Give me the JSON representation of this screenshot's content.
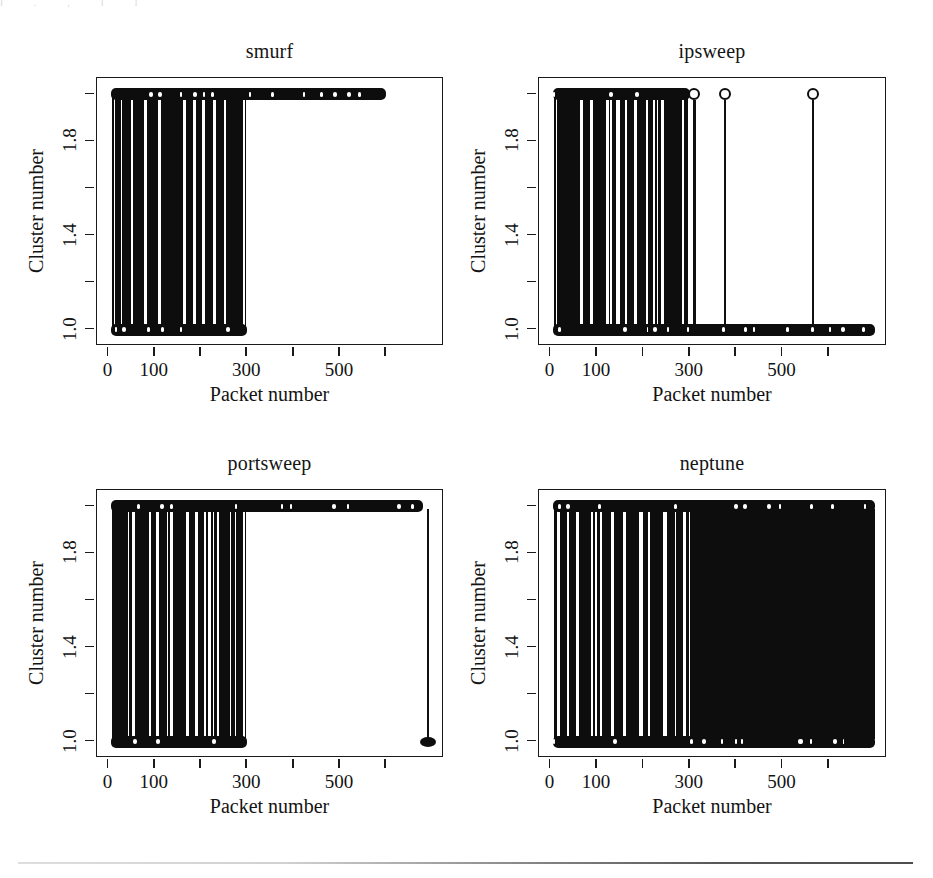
{
  "figure": {
    "width": 933,
    "height": 878,
    "background": "#ffffff",
    "ink": "#0d0d0d",
    "layout": "2x2 grid of panels",
    "scan_artifact_text": "l . , l l"
  },
  "axes": {
    "x_title": "Packet number",
    "y_title": "Cluster number",
    "x_ticks": [
      {
        "value": 0,
        "label": "0"
      },
      {
        "value": 100,
        "label": "100"
      },
      {
        "value": 200,
        "label": ""
      },
      {
        "value": 300,
        "label": "300"
      },
      {
        "value": 400,
        "label": ""
      },
      {
        "value": 500,
        "label": "500"
      },
      {
        "value": 600,
        "label": ""
      }
    ],
    "y_ticks": [
      {
        "value": 1.0,
        "label": "1.0"
      },
      {
        "value": 1.2,
        "label": ""
      },
      {
        "value": 1.4,
        "label": "1.4"
      },
      {
        "value": 1.6,
        "label": ""
      },
      {
        "value": 1.8,
        "label": "1.8"
      },
      {
        "value": 2.0,
        "label": ""
      }
    ],
    "xlim": [
      -25,
      725
    ],
    "ylim": [
      0.93,
      2.07
    ],
    "grid": false,
    "legend": "none"
  },
  "panels": [
    {
      "id": "smurf",
      "title": "smurf"
    },
    {
      "id": "ipsweep",
      "title": "ipsweep"
    },
    {
      "id": "portsweep",
      "title": "portsweep"
    },
    {
      "id": "neptune",
      "title": "neptune"
    }
  ],
  "chart_data": [
    {
      "type": "scatter",
      "title": "smurf",
      "xlabel": "Packet number",
      "ylabel": "Cluster number",
      "xlim": [
        -25,
        725
      ],
      "ylim": [
        0.93,
        2.07
      ],
      "grid": false,
      "marker": "open circle with vertical drop line",
      "description": "Cluster assignment (1 or 2) per packet. Dense alternating assignment for packets 0-300; cluster 2 occupied continuously out to packet ~600; cluster 1 occupied only over packets 0-300.",
      "series": [
        {
          "name": "cluster 2 occupancy",
          "y": 2,
          "x_intervals": [
            [
              5,
              600
            ]
          ]
        },
        {
          "name": "cluster 1 occupancy",
          "y": 1,
          "x_intervals": [
            [
              5,
              300
            ]
          ]
        }
      ],
      "vertical_link_intervals": [
        [
          8,
          298
        ]
      ]
    },
    {
      "type": "scatter",
      "title": "ipsweep",
      "xlabel": "Packet number",
      "ylabel": "Cluster number",
      "xlim": [
        -25,
        725
      ],
      "ylim": [
        0.93,
        2.07
      ],
      "grid": false,
      "marker": "open circle with vertical drop line",
      "description": "Dense alternating cluster assignment for packets 0-300, then three isolated cluster-2 points at roughly packets 310, 375 and 565; cluster 1 occupied continuously across the whole range 0-700.",
      "series": [
        {
          "name": "cluster 2 occupancy",
          "y": 2,
          "x_intervals": [
            [
              5,
              300
            ]
          ],
          "isolated_x": [
            310,
            375,
            565
          ]
        },
        {
          "name": "cluster 1 occupancy",
          "y": 1,
          "x_intervals": [
            [
              5,
              700
            ]
          ]
        }
      ],
      "vertical_link_intervals": [
        [
          8,
          298
        ]
      ]
    },
    {
      "type": "scatter",
      "title": "portsweep",
      "xlabel": "Packet number",
      "ylabel": "Cluster number",
      "xlim": [
        -25,
        725
      ],
      "ylim": [
        0.93,
        2.07
      ],
      "grid": false,
      "marker": "open circle with vertical drop line",
      "description": "Dense alternating cluster assignment for packets 0-300; cluster 2 occupied continuously to packet ~680; one isolated packet near 690 drops to cluster 1.",
      "series": [
        {
          "name": "cluster 2 occupancy",
          "y": 2,
          "x_intervals": [
            [
              5,
              680
            ]
          ]
        },
        {
          "name": "cluster 1 occupancy",
          "y": 1,
          "x_intervals": [
            [
              5,
              300
            ]
          ],
          "isolated_x": [
            690
          ]
        }
      ],
      "vertical_link_intervals": [
        [
          8,
          298
        ],
        [
          688,
          692
        ]
      ]
    },
    {
      "type": "scatter",
      "title": "neptune",
      "xlabel": "Packet number",
      "ylabel": "Cluster number",
      "xlim": [
        -25,
        725
      ],
      "ylim": [
        0.93,
        2.07
      ],
      "grid": false,
      "marker": "open circle with vertical drop line",
      "description": "Dense alternating cluster assignment for packets 0-300, then fully saturated alternation for packets 300-700 where both clusters are continuously occupied.",
      "series": [
        {
          "name": "cluster 2 occupancy",
          "y": 2,
          "x_intervals": [
            [
              5,
              700
            ]
          ]
        },
        {
          "name": "cluster 1 occupancy",
          "y": 1,
          "x_intervals": [
            [
              5,
              700
            ]
          ]
        }
      ],
      "vertical_link_intervals": [
        [
          8,
          298
        ],
        [
          300,
          700
        ]
      ]
    }
  ]
}
